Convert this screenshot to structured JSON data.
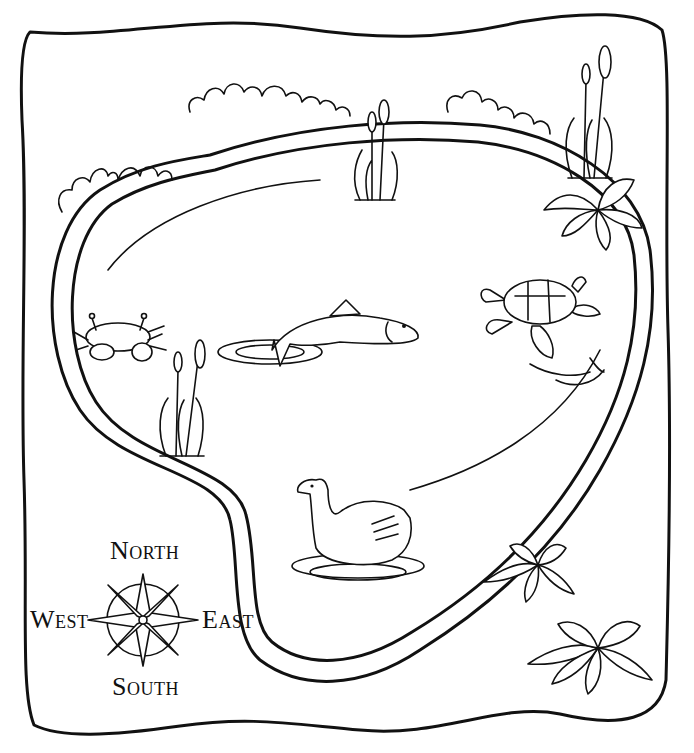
{
  "map": {
    "subject": "Pond map",
    "compass": {
      "north": {
        "cap": "N",
        "rest": "ORTH"
      },
      "south": {
        "cap": "S",
        "rest": "OUTH"
      },
      "east": {
        "cap": "E",
        "rest": "AST"
      },
      "west": {
        "cap": "W",
        "rest": "EST"
      }
    },
    "features": [
      "bushes",
      "cattails",
      "crab",
      "fish",
      "turtle",
      "swan",
      "lily plants"
    ],
    "colors": {
      "ink": "#111111",
      "paper": "#ffffff"
    }
  }
}
